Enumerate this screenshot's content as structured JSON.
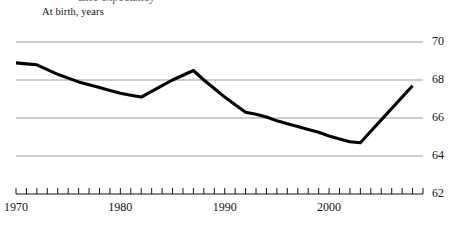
{
  "header": {
    "cropped_title": "Life expectancy",
    "subtitle": "At birth, years"
  },
  "colors": {
    "line": "#000000",
    "gridline": "#9a9a9a",
    "axis": "#151515",
    "text": "#151515",
    "background": "#ffffff"
  },
  "chart_data": {
    "type": "line",
    "title": "",
    "subtitle": "At birth, years",
    "xlabel": "",
    "ylabel": "",
    "xlim": [
      1970,
      2009
    ],
    "ylim": [
      62,
      70
    ],
    "ytick_labels": [
      "70",
      "68",
      "66",
      "64",
      "62"
    ],
    "ytick_values": [
      70,
      68,
      66,
      64,
      62
    ],
    "xtick_labels": [
      "1970",
      "1980",
      "1990",
      "2000"
    ],
    "xtick_values": [
      1970,
      1980,
      1990,
      2000
    ],
    "xtick_minor_step": 1,
    "grid": "horizontal",
    "legend": "none",
    "series": [
      {
        "name": "Life expectancy at birth",
        "x": [
          1970,
          1971,
          1972,
          1973,
          1974,
          1975,
          1976,
          1977,
          1978,
          1979,
          1980,
          1981,
          1982,
          1983,
          1984,
          1985,
          1986,
          1987,
          1988,
          1989,
          1990,
          1991,
          1992,
          1993,
          1994,
          1995,
          1996,
          1997,
          1998,
          1999,
          2000,
          2001,
          2002,
          2003,
          2004,
          2005,
          2006,
          2007,
          2008
        ],
        "values": [
          68.9,
          68.85,
          68.8,
          68.55,
          68.3,
          68.1,
          67.9,
          67.75,
          67.6,
          67.45,
          67.3,
          67.2,
          67.1,
          67.4,
          67.7,
          68.0,
          68.25,
          68.5,
          68.0,
          67.55,
          67.1,
          66.7,
          66.3,
          66.2,
          66.05,
          65.85,
          65.7,
          65.55,
          65.4,
          65.25,
          65.05,
          64.9,
          64.75,
          64.7,
          65.3,
          65.9,
          66.5,
          67.1,
          67.7
        ]
      }
    ]
  }
}
